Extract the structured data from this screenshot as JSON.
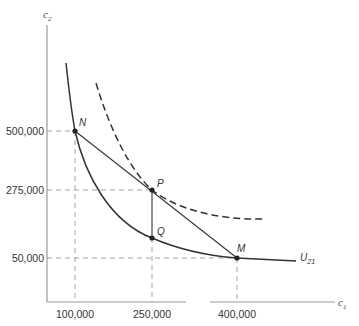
{
  "diagram": {
    "axes": {
      "x_label": "c",
      "x_label_sub": "1",
      "y_label": "c",
      "y_label_sub": "2"
    },
    "x_ticks": [
      {
        "label": "100,000",
        "value": 100000
      },
      {
        "label": "250,000",
        "value": 250000
      },
      {
        "label": "400,000",
        "value": 400000
      }
    ],
    "y_ticks": [
      {
        "label": "500,000",
        "value": 500000
      },
      {
        "label": "275,000",
        "value": 275000
      },
      {
        "label": "50,000",
        "value": 50000
      }
    ],
    "points": {
      "N": {
        "label": "N",
        "c1": 100000,
        "c2": 500000
      },
      "P": {
        "label": "P",
        "c1": 250000,
        "c2": 275000
      },
      "Q": {
        "label": "Q",
        "c1": 250000,
        "c2": 137000
      },
      "M": {
        "label": "M",
        "c1": 400000,
        "c2": 50000
      }
    },
    "curves": {
      "solid": {
        "label": "U",
        "label_sub": "21",
        "style": "solid"
      },
      "dashed": {
        "style": "dashed"
      },
      "chord": {
        "from": "N",
        "to": "M",
        "style": "solid"
      }
    },
    "colors": {
      "line": "#333333",
      "axis": "#999999",
      "guide": "#999999"
    }
  }
}
